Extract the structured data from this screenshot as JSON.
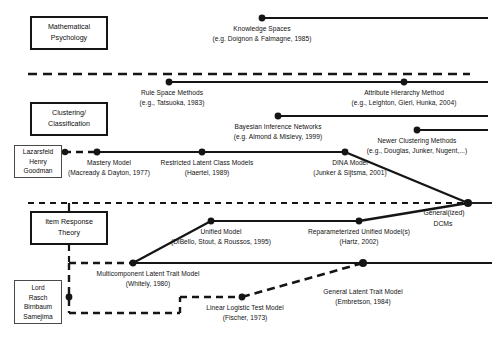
{
  "figure": {
    "background": "#ffffff",
    "line_color": "#151515",
    "width": 497,
    "height": 339
  },
  "tradition_boxes": [
    {
      "id": "mathematical-psychology",
      "line1": "Mathematical",
      "line2": "Psychology",
      "style": "thick",
      "x": 30,
      "y": 16,
      "w": 78,
      "h": 34
    },
    {
      "id": "clustering-classification",
      "line1": "Clustering/",
      "line2": "Classification",
      "style": "thick",
      "x": 30,
      "y": 102,
      "w": 78,
      "h": 34
    },
    {
      "id": "lazarsfeld-henry-goodman",
      "line1": "Lazarsfeld",
      "line2": "Henry",
      "line3": "Goodman",
      "style": "thin",
      "x": 14,
      "y": 145,
      "w": 48,
      "h": 33
    },
    {
      "id": "item-response-theory",
      "line1": "Item Response",
      "line2": "Theory",
      "style": "thick",
      "x": 30,
      "y": 211,
      "w": 78,
      "h": 34
    },
    {
      "id": "lord-rasch-birnbaum-samejima",
      "line1": "Lord",
      "line2": "Rasch",
      "line3": "Birnbaum",
      "line4": "Samejima",
      "style": "thin",
      "x": 14,
      "y": 280,
      "w": 48,
      "h": 44
    }
  ],
  "nodes": [
    {
      "id": "knowledge-spaces",
      "name": "Knowledge Spaces",
      "citation": "(e.g. Doignon & Falmagne, 1985)",
      "dot_x": 262,
      "dot_y": 18,
      "label_x": 262,
      "label_y": 24
    },
    {
      "id": "rule-space-methods",
      "name": "Rule Space Methods",
      "citation": "(e.g., Tatsuoka, 1983)",
      "dot_x": 169,
      "dot_y": 82,
      "label_x": 172,
      "label_y": 88
    },
    {
      "id": "attribute-hierarchy-method",
      "name": "Attribute Hierarchy Method",
      "citation": "(e.g., Leighton, Gierl, Hunka, 2004)",
      "dot_x": 404,
      "dot_y": 82,
      "label_x": 404,
      "label_y": 88
    },
    {
      "id": "bayesian-inference-networks",
      "name": "Bayesian Inference Networks",
      "citation": "(e.g. Almond & Mislevy, 1999)",
      "dot_x": 278,
      "dot_y": 116,
      "label_x": 278,
      "label_y": 122
    },
    {
      "id": "newer-clustering-methods",
      "name": "Newer Clustering Methods",
      "citation": "(e.g., Douglas, Junker, Nugent,...)",
      "dot_x": 417,
      "dot_y": 130,
      "label_x": 417,
      "label_y": 136
    },
    {
      "id": "mastery-model",
      "name": "Mastery Model",
      "citation": "(Macready & Dayton, 1977)",
      "dot_x": 97,
      "dot_y": 152,
      "label_x": 109,
      "label_y": 158
    },
    {
      "id": "restricted-latent-class-models",
      "name": "Restricted Latent Class Models",
      "citation": "(Haertel, 1989)",
      "dot_x": 202,
      "dot_y": 152,
      "label_x": 207,
      "label_y": 158
    },
    {
      "id": "dina-model",
      "name": "DINA Model",
      "citation": "(Junker & Sijtsma, 2001)",
      "dot_x": 345,
      "dot_y": 152,
      "label_x": 350,
      "label_y": 158
    },
    {
      "id": "unified-model",
      "name": "Unified Model",
      "citation": "(DiBello, Stout, & Roussos, 1995)",
      "dot_x": 211,
      "dot_y": 221,
      "label_x": 221,
      "label_y": 227
    },
    {
      "id": "reparameterized-unified-model",
      "name": "Reparameterized Unified Model(s)",
      "citation": "(Hartz, 2002)",
      "dot_x": 359,
      "dot_y": 221,
      "label_x": 359,
      "label_y": 227
    },
    {
      "id": "multicomponent-latent-trait-model",
      "name": "Multicomponent Latent Trait Model",
      "citation": "(Whitely, 1980)",
      "dot_x": 133,
      "dot_y": 263,
      "label_x": 148,
      "label_y": 269
    },
    {
      "id": "general-latent-trait-model",
      "name": "General Latent Trait Model",
      "citation": "(Embretson, 1984)",
      "dot_x": 363,
      "dot_y": 263,
      "label_x": 363,
      "label_y": 287
    },
    {
      "id": "linear-logistic-test-model",
      "name": "Linear Logistic Test Model",
      "citation": "(Fischer, 1973)",
      "dot_x": 242,
      "dot_y": 297,
      "label_x": 245,
      "label_y": 303
    }
  ],
  "convergence": {
    "id": "generalized-dcms",
    "line1": "General(ized)",
    "line2": "DCMs",
    "dot_x": 468,
    "dot_y": 203,
    "label_x": 444,
    "label_y": 208
  },
  "separators": [
    {
      "id": "separator-upper",
      "y": 74,
      "x1": 28,
      "x2": 470,
      "style": "dashed"
    },
    {
      "id": "separator-lower",
      "y": 203,
      "x1": 28,
      "x2": 468,
      "style": "dashed"
    }
  ]
}
